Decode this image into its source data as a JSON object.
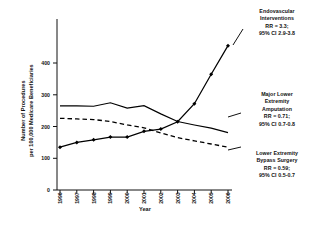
{
  "chart_data": {
    "type": "line",
    "title": "",
    "xlabel": "Year",
    "ylabel": "Number of Procedures per 100,000 Medicare Beneficiaries",
    "ylabel_lines": [
      "Number of Procedures",
      "per 100,000 Medicare Beneficiaries"
    ],
    "categories": [
      1996,
      1997,
      1998,
      1999,
      2000,
      2001,
      2002,
      2003,
      2004,
      2005,
      2006
    ],
    "xtick_labels": [
      "1996",
      "1997",
      "1998",
      "1999",
      "2000",
      "2001",
      "2002",
      "2003",
      "2004",
      "2005",
      "2006"
    ],
    "ytick_labels": [
      "0",
      "100",
      "200",
      "300",
      "400"
    ],
    "yticks": [
      0,
      100,
      200,
      300,
      400
    ],
    "ylim": [
      0,
      470
    ],
    "xlim": [
      1996,
      2006
    ],
    "grid": false,
    "legend_position": "right-annotations",
    "series": [
      {
        "name": "Endovascular Interventions",
        "style": "solid-with-diamond-markers",
        "color": "#000000",
        "values": [
          135,
          150,
          158,
          167,
          167,
          185,
          192,
          215,
          272,
          365,
          455
        ]
      },
      {
        "name": "Major Lower Extremity Amputation",
        "style": "solid",
        "color": "#000000",
        "values": [
          265,
          265,
          264,
          275,
          258,
          266,
          240,
          216,
          205,
          195,
          181
        ]
      },
      {
        "name": "Lower Extremity Bypass Surgery",
        "style": "dashed",
        "color": "#000000",
        "values": [
          226,
          224,
          222,
          216,
          205,
          196,
          180,
          165,
          155,
          145,
          135
        ]
      }
    ],
    "annotations": [
      {
        "id": "endovascular",
        "lines": [
          "Endovascular",
          "Interventions",
          "RR = 3.3;",
          "95% CI 2.9-3.8"
        ],
        "target_series": "Endovascular Interventions"
      },
      {
        "id": "amputation",
        "lines": [
          "Major Lower",
          "Extremity",
          "Amputation",
          "RR = 0.71;",
          "95% CI 0.7-0.8"
        ],
        "target_series": "Major Lower Extremity Amputation"
      },
      {
        "id": "bypass",
        "lines": [
          "Lower Extremity",
          "Bypass Surgery",
          "RR = 0.59;",
          "95% CI 0.5-0.7"
        ],
        "target_series": "Lower Extremity Bypass Surgery"
      }
    ]
  }
}
